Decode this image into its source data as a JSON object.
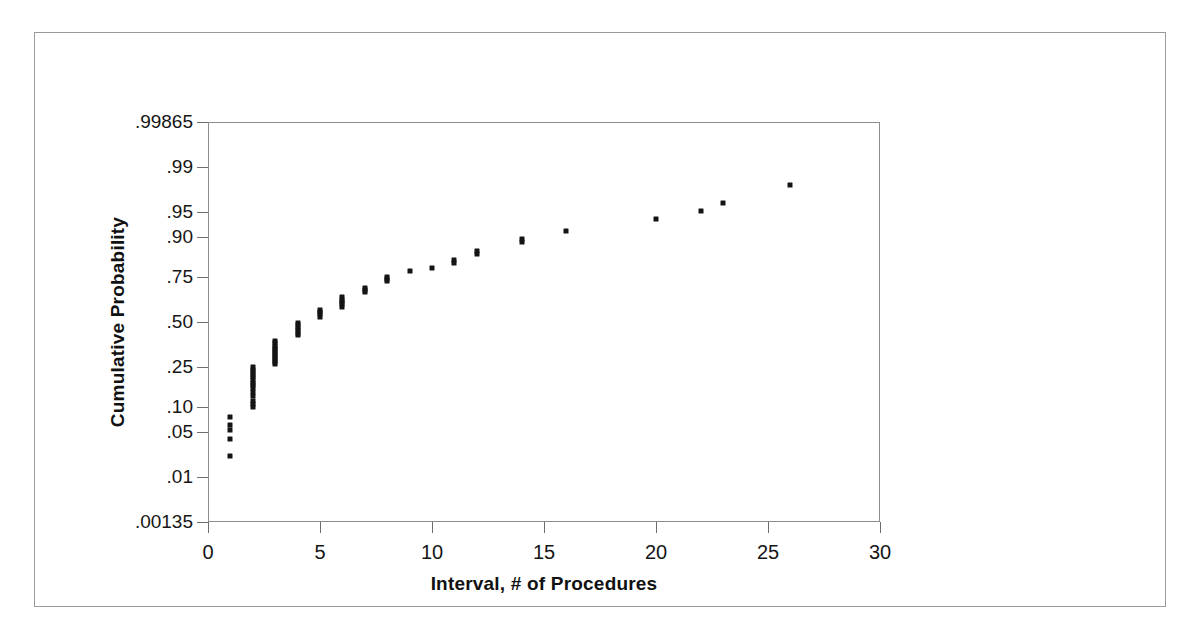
{
  "chart_data": {
    "type": "scatter",
    "title": "",
    "xlabel": "Interval, # of Procedures",
    "ylabel": "Cumulative Probability",
    "grid": false,
    "legend": null,
    "xlim": [
      0,
      30
    ],
    "x_ticks": [
      0,
      5,
      10,
      15,
      20,
      25,
      30
    ],
    "x_tick_labels": [
      "0",
      "5",
      "10",
      "15",
      "20",
      "25",
      "30"
    ],
    "y_scale": "normal-probability",
    "y_ticks": [
      0.00135,
      0.01,
      0.05,
      0.1,
      0.25,
      0.5,
      0.75,
      0.9,
      0.95,
      0.99,
      0.99865
    ],
    "y_tick_labels": [
      ".00135",
      ".01",
      ".05",
      ".10",
      ".25",
      ".50",
      ".75",
      ".90",
      ".95",
      ".99",
      ".99865"
    ],
    "ylim": [
      0.00135,
      0.99865
    ],
    "points": [
      {
        "x": 1,
        "y": 0.022
      },
      {
        "x": 1,
        "y": 0.04
      },
      {
        "x": 1,
        "y": 0.052
      },
      {
        "x": 1,
        "y": 0.062
      },
      {
        "x": 1,
        "y": 0.078
      },
      {
        "x": 2,
        "y": 0.1
      },
      {
        "x": 2,
        "y": 0.108
      },
      {
        "x": 2,
        "y": 0.118
      },
      {
        "x": 2,
        "y": 0.132
      },
      {
        "x": 2,
        "y": 0.148
      },
      {
        "x": 2,
        "y": 0.16
      },
      {
        "x": 2,
        "y": 0.172
      },
      {
        "x": 2,
        "y": 0.182
      },
      {
        "x": 2,
        "y": 0.193
      },
      {
        "x": 2,
        "y": 0.204
      },
      {
        "x": 2,
        "y": 0.215
      },
      {
        "x": 2,
        "y": 0.226
      },
      {
        "x": 2,
        "y": 0.238
      },
      {
        "x": 2,
        "y": 0.25
      },
      {
        "x": 3,
        "y": 0.262
      },
      {
        "x": 3,
        "y": 0.272
      },
      {
        "x": 3,
        "y": 0.283
      },
      {
        "x": 3,
        "y": 0.294
      },
      {
        "x": 3,
        "y": 0.305
      },
      {
        "x": 3,
        "y": 0.316
      },
      {
        "x": 3,
        "y": 0.327
      },
      {
        "x": 3,
        "y": 0.338
      },
      {
        "x": 3,
        "y": 0.35
      },
      {
        "x": 3,
        "y": 0.362
      },
      {
        "x": 3,
        "y": 0.374
      },
      {
        "x": 3,
        "y": 0.386
      },
      {
        "x": 4,
        "y": 0.42
      },
      {
        "x": 4,
        "y": 0.435
      },
      {
        "x": 4,
        "y": 0.45
      },
      {
        "x": 4,
        "y": 0.465
      },
      {
        "x": 4,
        "y": 0.48
      },
      {
        "x": 4,
        "y": 0.495
      },
      {
        "x": 5,
        "y": 0.53
      },
      {
        "x": 5,
        "y": 0.545
      },
      {
        "x": 5,
        "y": 0.56
      },
      {
        "x": 5,
        "y": 0.572
      },
      {
        "x": 6,
        "y": 0.59
      },
      {
        "x": 6,
        "y": 0.605
      },
      {
        "x": 6,
        "y": 0.618
      },
      {
        "x": 6,
        "y": 0.632
      },
      {
        "x": 6,
        "y": 0.645
      },
      {
        "x": 7,
        "y": 0.672
      },
      {
        "x": 7,
        "y": 0.685
      },
      {
        "x": 7,
        "y": 0.697
      },
      {
        "x": 8,
        "y": 0.73
      },
      {
        "x": 8,
        "y": 0.742
      },
      {
        "x": 8,
        "y": 0.752
      },
      {
        "x": 9,
        "y": 0.778
      },
      {
        "x": 10,
        "y": 0.79
      },
      {
        "x": 11,
        "y": 0.812
      },
      {
        "x": 11,
        "y": 0.822
      },
      {
        "x": 12,
        "y": 0.845
      },
      {
        "x": 12,
        "y": 0.855
      },
      {
        "x": 14,
        "y": 0.885
      },
      {
        "x": 14,
        "y": 0.893
      },
      {
        "x": 16,
        "y": 0.915
      },
      {
        "x": 20,
        "y": 0.938
      },
      {
        "x": 22,
        "y": 0.952
      },
      {
        "x": 23,
        "y": 0.963
      },
      {
        "x": 26,
        "y": 0.98
      }
    ]
  },
  "figure": {
    "border_color": "#9a9a9a",
    "axis_color": "#8d8d8d",
    "marker_color": "#141414"
  }
}
